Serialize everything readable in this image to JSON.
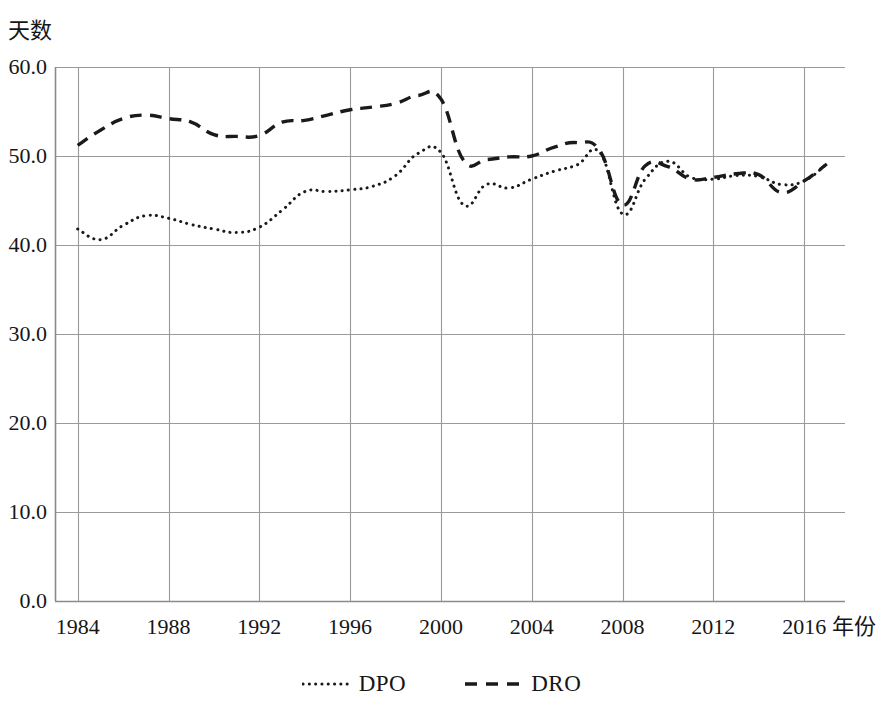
{
  "chart_data": {
    "type": "line",
    "title": "",
    "xlabel": "年份",
    "ylabel": "天数",
    "xlim": [
      1983,
      2017.8
    ],
    "ylim": [
      0.0,
      60.0
    ],
    "yticks": [
      "0.0",
      "10.0",
      "20.0",
      "30.0",
      "40.0",
      "50.0",
      "60.0"
    ],
    "ytick_values": [
      0.0,
      10.0,
      20.0,
      30.0,
      40.0,
      50.0,
      60.0
    ],
    "xticks": [
      "1984",
      "1988",
      "1992",
      "1996",
      "2000",
      "2004",
      "2008",
      "2012",
      "2016"
    ],
    "xtick_values": [
      1984,
      1988,
      1992,
      1996,
      2000,
      2004,
      2008,
      2012,
      2016
    ],
    "grid": true,
    "legend_position": "bottom",
    "x": [
      1984,
      1985,
      1986,
      1987,
      1988,
      1989,
      1990,
      1991,
      1992,
      1993,
      1994,
      1995,
      1996,
      1997,
      1998,
      1999,
      2000,
      2001,
      2002,
      2003,
      2004,
      2005,
      2006,
      2007,
      2008,
      2009,
      2010,
      2011,
      2012,
      2013,
      2014,
      2015,
      2016,
      2017
    ],
    "series": [
      {
        "name": "DPO",
        "style": "dotted",
        "color": "#1a1a1a",
        "values": [
          41.8,
          40.6,
          42.2,
          43.3,
          43.0,
          42.3,
          41.8,
          41.4,
          42.0,
          43.9,
          46.0,
          46.0,
          46.2,
          46.6,
          47.8,
          50.3,
          50.4,
          44.5,
          46.8,
          46.4,
          47.4,
          48.3,
          49.0,
          50.4,
          43.5,
          47.4,
          49.4,
          47.6,
          47.4,
          47.8,
          47.7,
          46.8,
          47.2,
          49.1
        ]
      },
      {
        "name": "DRO",
        "style": "dashed",
        "color": "#1a1a1a",
        "values": [
          51.2,
          52.9,
          54.2,
          54.6,
          54.2,
          53.8,
          52.4,
          52.2,
          52.3,
          53.8,
          54.0,
          54.6,
          55.2,
          55.5,
          55.9,
          56.8,
          56.4,
          49.5,
          49.6,
          49.9,
          50.0,
          51.0,
          51.5,
          50.6,
          44.5,
          48.9,
          48.8,
          47.4,
          47.6,
          48.0,
          47.9,
          45.9,
          47.2,
          49.1
        ]
      }
    ],
    "legend": [
      {
        "label": "DPO",
        "style": "dotted"
      },
      {
        "label": "DRO",
        "style": "dashed"
      }
    ]
  },
  "plot_geometry": {
    "left": 55,
    "top": 67,
    "right": 845,
    "bottom": 601
  }
}
